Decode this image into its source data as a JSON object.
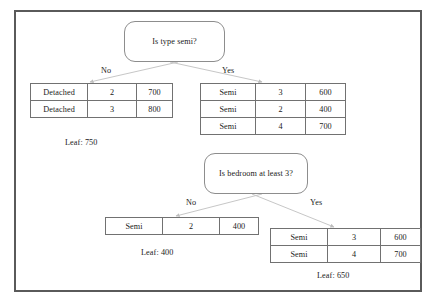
{
  "diagram": {
    "frame_color": "#5a5a5a",
    "node_border_color": "#8d8d8d",
    "table_border_color": "#717171",
    "edge_color": "#c0c0c0"
  },
  "nodes": {
    "root": {
      "question": "Is type semi?",
      "branch_no_label": "No",
      "branch_yes_label": "Yes"
    },
    "bedroom": {
      "question": "Is bedroom at least 3?",
      "branch_no_label": "No",
      "branch_yes_label": "Yes"
    }
  },
  "tables": {
    "detached": {
      "name": "detached-table",
      "rows": [
        {
          "type": "Detached",
          "bedrooms": "2",
          "price": "700"
        },
        {
          "type": "Detached",
          "bedrooms": "3",
          "price": "800"
        }
      ]
    },
    "semi_top": {
      "name": "semi-table",
      "rows": [
        {
          "type": "Semi",
          "bedrooms": "3",
          "price": "600"
        },
        {
          "type": "Semi",
          "bedrooms": "2",
          "price": "400"
        },
        {
          "type": "Semi",
          "bedrooms": "4",
          "price": "700"
        }
      ]
    },
    "semi_no": {
      "name": "semi-fewer-bedrooms-table",
      "rows": [
        {
          "type": "Semi",
          "bedrooms": "2",
          "price": "400"
        }
      ]
    },
    "semi_yes": {
      "name": "semi-three-or-more-bedrooms-table",
      "rows": [
        {
          "type": "Semi",
          "bedrooms": "3",
          "price": "600"
        },
        {
          "type": "Semi",
          "bedrooms": "4",
          "price": "700"
        }
      ]
    }
  },
  "leaves": {
    "detached": "Leaf: 750",
    "semi_no": "Leaf: 400",
    "semi_yes": "Leaf: 650"
  }
}
